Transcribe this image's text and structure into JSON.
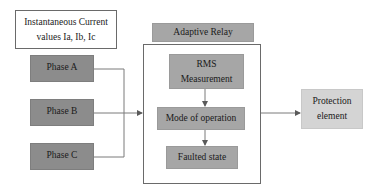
{
  "diagram": {
    "input_label": {
      "line1": "Instantaneous Current",
      "line2": "values Ia, Ib, Ic"
    },
    "phases": [
      {
        "label": "Phase A"
      },
      {
        "label": "Phase B"
      },
      {
        "label": "Phase C"
      }
    ],
    "relay": {
      "title": "Adaptive Relay",
      "steps": [
        {
          "line1": "RMS",
          "line2": "Measurement"
        },
        {
          "label": "Mode of operation"
        },
        {
          "label": "Faulted state"
        }
      ]
    },
    "output": {
      "line1": "Protection",
      "line2": "element"
    },
    "colors": {
      "phase_fill": "#8c8c8c",
      "step_fill": "#a6a6a6",
      "output_fill": "#d4d4d4",
      "line": "#6a6a6a"
    }
  }
}
